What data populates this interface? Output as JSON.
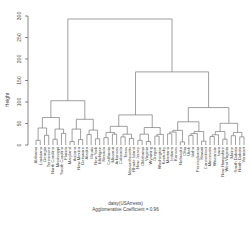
{
  "chart_data": {
    "type": "dendrogram",
    "ylabel": "Height",
    "xlabel": "daisy(USArrests)",
    "subtitle": "Agglomerative Coefficient = 0.96",
    "yticks": [
      0,
      50,
      100,
      150,
      200,
      250,
      300
    ],
    "ylim": [
      0,
      300
    ],
    "merges": [
      {
        "name": "root",
        "height": 293
      },
      {
        "name": "left-cluster",
        "height": 103
      },
      {
        "name": "right-cluster",
        "height": 170
      },
      {
        "name": "right-left-subcluster",
        "height": 70
      },
      {
        "name": "right-right-subcluster",
        "height": 87
      }
    ],
    "leaves": [
      "Alabama",
      "Louisiana",
      "Georgia",
      "Tennessee",
      "North Carolina",
      "Mississippi",
      "South Carolina",
      "Florida",
      "Maryland",
      "Arizona",
      "New Mexico",
      "Delaware",
      "Alaska",
      "Illinois",
      "New York",
      "Michigan",
      "Nevada",
      "California",
      "Missouri",
      "Arkansas",
      "Colorado",
      "Texas",
      "Massachusetts",
      "Rhode Island",
      "New Jersey",
      "Oklahoma",
      "Virginia",
      "Wyoming",
      "Oregon",
      "Washington",
      "Kentucky",
      "Montana",
      "Indiana",
      "Kansas",
      "Nebraska",
      "Ohio",
      "Utah",
      "Idaho",
      "Pennsylvania",
      "Hawaii",
      "Connecticut",
      "Minnesota",
      "Wisconsin",
      "Iowa",
      "New Hampshire",
      "West Virginia",
      "Maine",
      "South Dakota",
      "North Dakota",
      "Vermont"
    ]
  },
  "axis": {
    "ylabel": "Height"
  },
  "caption": {
    "line1": "daisy(USArrests)",
    "line2": "Agglomerative Coefficient = 0.96"
  }
}
